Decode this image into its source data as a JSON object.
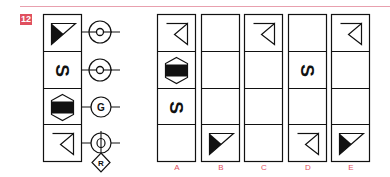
{
  "question": {
    "number": "12",
    "accent_color": "#e0505f",
    "rule_color": "#e8a0ae"
  },
  "stack": {
    "cells": [
      {
        "symbol": "triangle-filled-half",
        "connector": "circle-dot"
      },
      {
        "symbol": "letter-s-rotated",
        "letter": "S",
        "connector": "circle-dot"
      },
      {
        "symbol": "hexagon-filled-band",
        "connector": "circle-letter",
        "connector_label": "G"
      },
      {
        "symbol": "triangle-outline-with-line",
        "connector": "circle-phi-with-diamond",
        "diamond_label": "R"
      }
    ]
  },
  "options": [
    {
      "label": "A",
      "cells": [
        "triangle-outline-with-line",
        "hexagon-filled-band",
        "letter-s-rotated",
        "empty"
      ]
    },
    {
      "label": "B",
      "cells": [
        "empty",
        "empty",
        "empty",
        "triangle-filled-half"
      ]
    },
    {
      "label": "C",
      "cells": [
        "triangle-outline-with-line",
        "empty",
        "empty",
        "empty"
      ]
    },
    {
      "label": "D",
      "cells": [
        "empty",
        "letter-s-rotated",
        "empty",
        "triangle-outline-with-line"
      ]
    },
    {
      "label": "E",
      "cells": [
        "triangle-outline-with-line",
        "empty",
        "empty",
        "triangle-filled-half"
      ]
    }
  ],
  "glyphs": {
    "s": "S",
    "g": "G",
    "r": "R"
  }
}
